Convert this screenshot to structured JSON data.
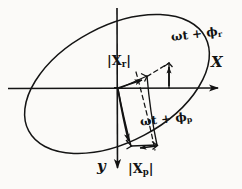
{
  "figure": {
    "background_color": "#fbfaf8",
    "ink_color": "#121212"
  },
  "axes": {
    "x_label": "X",
    "y_label": "y",
    "origin": {
      "x": 117,
      "y": 88
    },
    "x_axis": {
      "from_x": 8,
      "to_x": 234,
      "y": 88,
      "arrow": "right"
    },
    "y_axis": {
      "x": 117,
      "from_y": 8,
      "to_y": 176,
      "arrow": "down"
    }
  },
  "labels": {
    "magnitude_r": "|X",
    "magnitude_r_sub": "r",
    "magnitude_r_close": "|",
    "magnitude_p": "|X",
    "magnitude_p_sub": "p",
    "magnitude_p_close": "|",
    "phase_r": "ωt + ϕ",
    "phase_r_sub": "r",
    "phase_p": "ωt + ϕ",
    "phase_p_sub": "p"
  },
  "ellipse": {
    "center_x": 117,
    "center_y": 84,
    "radius_major": 100,
    "radius_minor": 58,
    "rotation_deg": -28,
    "stroke_width": 1.4
  },
  "vectors": [
    {
      "name": "xr-component",
      "from": {
        "x": 117,
        "y": 88
      },
      "to": {
        "x": 146,
        "y": 80
      },
      "style": "solid-arrow",
      "label": "|Xr|"
    },
    {
      "name": "xp-component",
      "from": {
        "x": 117,
        "y": 88
      },
      "to": {
        "x": 132,
        "y": 150
      },
      "style": "solid-arrow",
      "label": "|Xp|"
    },
    {
      "name": "resultant-projection-r",
      "from": {
        "x": 168,
        "y": 64
      },
      "to": {
        "x": 168,
        "y": 88
      },
      "style": "solid-arrow-up"
    },
    {
      "name": "resultant-projection-p",
      "from": {
        "x": 158,
        "y": 146
      },
      "to": {
        "x": 139,
        "y": 152
      },
      "style": "solid-arrow"
    }
  ],
  "dashed_lines": [
    {
      "name": "construction-line-r",
      "from": {
        "x": 147,
        "y": 76
      },
      "to": {
        "x": 168,
        "y": 62
      }
    },
    {
      "name": "construction-line-p",
      "from": {
        "x": 136,
        "y": 73
      },
      "to": {
        "x": 154,
        "y": 151
      }
    }
  ],
  "right_angle_marks": [
    {
      "x": 143,
      "y": 74
    },
    {
      "x": 165,
      "y": 64
    },
    {
      "x": 130,
      "y": 142
    },
    {
      "x": 152,
      "y": 147
    }
  ]
}
